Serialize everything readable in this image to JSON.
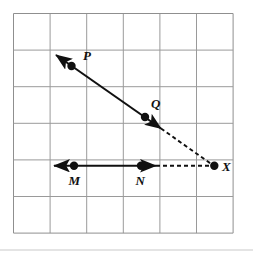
{
  "figure": {
    "background_color": "#ffffff",
    "grid": {
      "line_color": "#9a9a9a",
      "border_color": "#8f8f8f",
      "cell_size": 36.6,
      "columns": 6,
      "rows": 6,
      "origin_x": 13.5,
      "origin_y": 13.5,
      "width": 219.6,
      "height": 219.6
    },
    "baseline": {
      "color": "#c9c9c9",
      "y": 250
    },
    "stroke_color": "#101010",
    "points": [
      {
        "id": "P",
        "label": "P",
        "x": 71.5,
        "y": 66.0,
        "label_x": 83.0,
        "label_y": 60.0,
        "radius": 4.2
      },
      {
        "id": "Q",
        "label": "Q",
        "x": 145.0,
        "y": 117.0,
        "label_x": 151.0,
        "label_y": 108.0,
        "radius": 4.2
      },
      {
        "id": "M",
        "label": "M",
        "x": 74.0,
        "y": 165.7,
        "label_x": 68.5,
        "label_y": 185.0,
        "radius": 4.2
      },
      {
        "id": "N",
        "label": "N",
        "x": 141.0,
        "y": 165.7,
        "label_x": 135.5,
        "label_y": 185.0,
        "radius": 4.2
      },
      {
        "id": "X",
        "label": "X",
        "x": 214.3,
        "y": 165.7,
        "label_x": 222.0,
        "label_y": 171.0,
        "radius": 4.2
      }
    ],
    "rays": [
      {
        "id": "ray-PQ",
        "style": "solid",
        "description": "solid ray through P and Q with arrowheads at both ends",
        "x1": 56.0,
        "y1": 55.0,
        "x2": 161.0,
        "y2": 128.5,
        "arrow_start": true,
        "arrow_end": true
      },
      {
        "id": "ray-MN",
        "style": "solid",
        "description": "solid ray through M and N with arrowheads at both ends",
        "x1": 54.0,
        "y1": 165.7,
        "x2": 156.0,
        "y2": 165.7,
        "arrow_start": true,
        "arrow_end": true
      }
    ],
    "dashed_segments": [
      {
        "id": "dashed-QX",
        "description": "dashed segment from ray PQ arrowhead down to X",
        "x1": 161.0,
        "y1": 128.5,
        "x2": 212.0,
        "y2": 164.5,
        "dash_pattern": "4,3"
      },
      {
        "id": "dashed-NX",
        "description": "dashed segment from ray MN arrowhead right to X",
        "x1": 156.0,
        "y1": 165.7,
        "x2": 211.0,
        "y2": 165.7,
        "dash_pattern": "4,3"
      }
    ]
  }
}
